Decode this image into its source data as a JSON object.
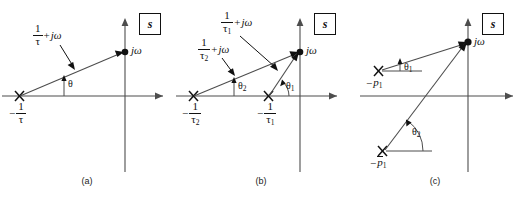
{
  "figure": {
    "width": 522,
    "height": 199,
    "background": "#ffffff",
    "line_color": "#4d4d4d",
    "ink_color": "#111111"
  },
  "panels": [
    {
      "id": "a",
      "caption": "(a)",
      "plane_label": "s",
      "point_label": "jω",
      "poles": [
        {
          "name": "pole-1",
          "label_minus": "−",
          "label_num": "1",
          "label_den": "τ",
          "marker": "×"
        }
      ],
      "vectors": [
        {
          "name": "vector-tau",
          "label_num": "1",
          "label_den": "τ",
          "label_plus": "+",
          "label_jw": "jω"
        }
      ],
      "angles": [
        {
          "name": "angle-theta",
          "label": "θ"
        }
      ]
    },
    {
      "id": "b",
      "caption": "(b)",
      "plane_label": "s",
      "point_label": "jω",
      "poles": [
        {
          "name": "pole-tau2",
          "label_minus": "−",
          "label_num": "1",
          "label_den": "τ",
          "label_sub": "2",
          "marker": "×"
        },
        {
          "name": "pole-tau1",
          "label_minus": "−",
          "label_num": "1",
          "label_den": "τ",
          "label_sub": "1",
          "marker": "×"
        }
      ],
      "vectors": [
        {
          "name": "vector-tau1",
          "label_num": "1",
          "label_den": "τ",
          "label_sub": "1",
          "label_plus": "+",
          "label_jw": "jω"
        },
        {
          "name": "vector-tau2",
          "label_num": "1",
          "label_den": "τ",
          "label_sub": "2",
          "label_plus": "+",
          "label_jw": "jω"
        }
      ],
      "angles": [
        {
          "name": "angle-theta1",
          "label": "θ",
          "sub": "1"
        },
        {
          "name": "angle-theta2",
          "label": "θ",
          "sub": "2"
        }
      ]
    },
    {
      "id": "c",
      "caption": "(c)",
      "plane_label": "s",
      "point_label": "jω",
      "poles": [
        {
          "name": "pole-p1",
          "label_minus": "−",
          "label_p": "p",
          "label_sub": "1",
          "marker": "×",
          "conjugate": false
        },
        {
          "name": "pole-p1-conj",
          "label_minus": "−",
          "label_p": "p",
          "label_sub": "1",
          "marker": "×",
          "conjugate": true
        }
      ],
      "angles": [
        {
          "name": "angle-theta1",
          "label": "θ",
          "sub": "1"
        },
        {
          "name": "angle-theta2",
          "label": "θ",
          "sub": "2"
        }
      ]
    }
  ]
}
